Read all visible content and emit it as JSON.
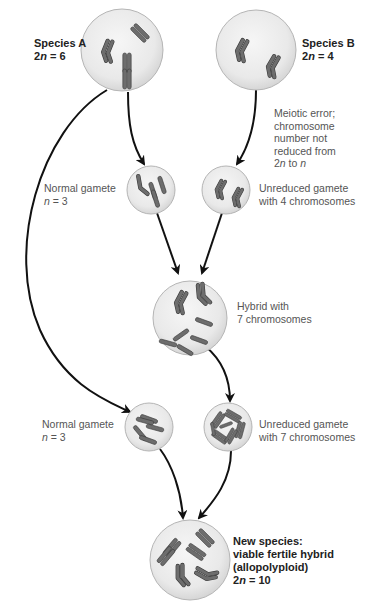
{
  "colors": {
    "cell_fill": "#ededed",
    "cell_stroke": "#b5b5b5",
    "chromosome_fill": "#6d6d6d",
    "chromosome_stroke": "#3a3a3a",
    "arrow": "#111111",
    "label_text": "#555555",
    "bold_label_text": "#222222"
  },
  "nodes": {
    "species_a": {
      "title": "Species A",
      "ploidy_prefix": "2",
      "ploidy_var": "n",
      "ploidy_suffix": " = 6"
    },
    "species_b": {
      "title": "Species B",
      "ploidy_prefix": "2",
      "ploidy_var": "n",
      "ploidy_suffix": " = 4"
    },
    "meiotic_error_note": {
      "lines": [
        "Meiotic error;",
        "chromosome",
        "number not",
        "reduced from"
      ],
      "last_line_prefix": "2",
      "last_line_var1": "n",
      "last_line_mid": " to ",
      "last_line_var2": "n"
    },
    "normal_gamete_1": {
      "line1": "Normal gamete",
      "var": "n",
      "suffix": " = 3"
    },
    "unreduced_gamete_4": {
      "line1": "Unreduced gamete",
      "line2": "with 4 chromosomes"
    },
    "hybrid": {
      "line1": "Hybrid with",
      "line2": "7 chromosomes"
    },
    "normal_gamete_2": {
      "line1": "Normal gamete",
      "var": "n",
      "suffix": " = 3"
    },
    "unreduced_gamete_7": {
      "line1": "Unreduced gamete",
      "line2": "with 7 chromosomes"
    },
    "new_species": {
      "line1": "New species:",
      "line2": "viable fertile hybrid",
      "line3": "(allopolyploid)",
      "ploidy_prefix": "2",
      "ploidy_var": "n",
      "ploidy_suffix": " = 10"
    }
  },
  "chromosome_counts": {
    "species_a": 6,
    "species_b": 4,
    "normal_gamete_1": 3,
    "unreduced_gamete_4": 4,
    "hybrid": 7,
    "normal_gamete_2": 3,
    "unreduced_gamete_7": 7,
    "new_species": 10
  }
}
